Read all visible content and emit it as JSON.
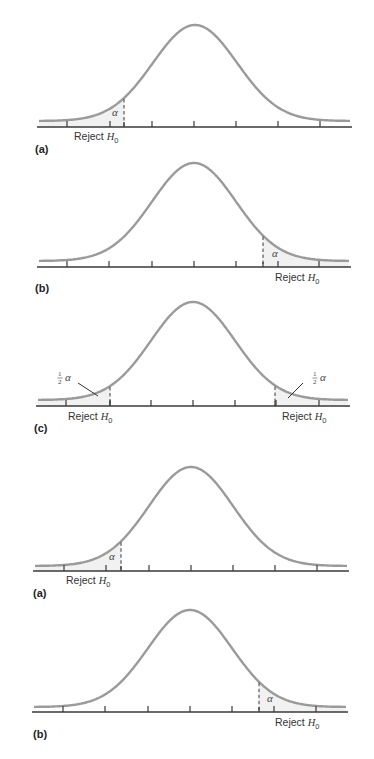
{
  "figure": {
    "colors": {
      "curve": "#9a9a9a",
      "axis": "#3a3a3a",
      "shade": "#f1f1f1",
      "text": "#333333"
    },
    "panels": [
      {
        "id": "a",
        "label": "(a)",
        "type": "left-tailed",
        "tail_label": "α",
        "reject_label": "Reject H",
        "reject_sub": "0",
        "geom": {
          "axisY": 127,
          "x0": 37,
          "x1": 352,
          "peakX": 195,
          "peakY": 25,
          "sigma": 42,
          "baseY": 121,
          "ticks": [
            67,
            110,
            152,
            194,
            236,
            278,
            320
          ],
          "crit": [
            124
          ],
          "alphaPos": [
            [
              112,
              116
            ]
          ],
          "rejectPos": [
            [
              74,
              140
            ]
          ],
          "idPos": [
            35,
            153
          ]
        }
      },
      {
        "id": "b",
        "label": "(b)",
        "type": "right-tailed",
        "tail_label": "α",
        "reject_label": "Reject H",
        "reject_sub": "0",
        "geom": {
          "axisY": 267,
          "x0": 37,
          "x1": 351,
          "peakX": 194,
          "peakY": 163,
          "sigma": 42,
          "baseY": 261,
          "ticks": [
            67,
            109,
            152,
            194,
            236,
            278,
            319
          ],
          "crit": [
            263
          ],
          "alphaPos": [
            [
              272,
              257
            ]
          ],
          "rejectPos": [
            [
              275,
              281
            ]
          ],
          "idPos": [
            35,
            292
          ]
        }
      },
      {
        "id": "c",
        "label": "(c)",
        "type": "two-tailed",
        "tail_label": "α",
        "half_numerator": "1",
        "half_denominator": "2",
        "reject_label": "Reject H",
        "reject_sub": "0",
        "geom": {
          "axisY": 406,
          "x0": 36,
          "x1": 350,
          "peakX": 193,
          "peakY": 302,
          "sigma": 42,
          "baseY": 400,
          "ticks": [
            66,
            110,
            151,
            193,
            235,
            276,
            319
          ],
          "crit": [
            110,
            275
          ],
          "halfPos": [
            [
              58,
              381
            ],
            [
              313,
              381
            ]
          ],
          "leaders": [
            [
              [
                78,
                383
              ],
              [
                98,
                396
              ]
            ],
            [
              [
                303,
                383
              ],
              [
                288,
                398
              ]
            ]
          ],
          "rejectPos": [
            [
              68,
              420
            ],
            [
              282,
              420
            ]
          ],
          "idPos": [
            34,
            432
          ]
        }
      },
      {
        "id": "a2",
        "label": "(a)",
        "type": "left-tailed",
        "tail_label": "α",
        "reject_label": "Reject H",
        "reject_sub": "0",
        "geom": {
          "axisY": 571,
          "x0": 33,
          "x1": 349,
          "peakX": 191,
          "peakY": 467,
          "sigma": 42,
          "baseY": 566,
          "ticks": [
            64,
            106,
            149,
            191,
            233,
            275,
            317
          ],
          "crit": [
            121
          ],
          "alphaPos": [
            [
              109,
              560
            ]
          ],
          "rejectPos": [
            [
              66,
              584
            ]
          ],
          "idPos": [
            33,
            597
          ]
        }
      },
      {
        "id": "b2",
        "label": "(b)",
        "type": "right-tailed",
        "tail_label": "α",
        "reject_label": "Reject H",
        "reject_sub": "0",
        "geom": {
          "axisY": 712,
          "x0": 32,
          "x1": 348,
          "peakX": 190,
          "peakY": 610,
          "sigma": 42,
          "baseY": 707,
          "ticks": [
            63,
            105,
            148,
            190,
            232,
            274,
            316
          ],
          "crit": [
            259
          ],
          "alphaPos": [
            [
              267,
              702
            ]
          ],
          "rejectPos": [
            [
              275,
              726
            ]
          ],
          "idPos": [
            33,
            738
          ]
        }
      }
    ]
  }
}
